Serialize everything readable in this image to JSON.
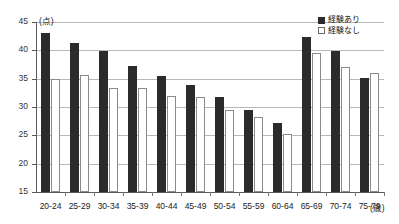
{
  "chart_data": {
    "type": "bar",
    "title": "",
    "subtitle": "",
    "xlabel": "(歳)",
    "ylabel": "(点)",
    "ylim": [
      15,
      45
    ],
    "ytick_step": 5,
    "yticks": [
      15,
      20,
      25,
      30,
      35,
      40,
      45
    ],
    "grid": true,
    "grid_axis": "y",
    "legend_position": "top-right",
    "categories": [
      "20-24",
      "25-29",
      "30-34",
      "35-39",
      "40-44",
      "45-49",
      "50-54",
      "55-59",
      "60-64",
      "65-69",
      "70-74",
      "75-79"
    ],
    "series": [
      {
        "name": "経験あり",
        "color": "#2b2b2b",
        "style": "filled",
        "values": [
          43.0,
          41.3,
          39.8,
          37.3,
          35.4,
          33.9,
          31.8,
          29.4,
          27.2,
          42.4,
          39.9,
          35.1
        ]
      },
      {
        "name": "経験なし",
        "color": "#ffffff",
        "style": "outlined",
        "values": [
          35.0,
          35.6,
          33.3,
          33.3,
          32.0,
          31.7,
          29.5,
          28.3,
          25.2,
          39.5,
          37.0,
          36.0
        ]
      }
    ]
  },
  "legend": {
    "items": [
      {
        "label": "経験あり",
        "marker": "filled-square"
      },
      {
        "label": "経験なし",
        "marker": "outlined-square"
      }
    ]
  },
  "axes": {
    "y_unit_label": "(点)",
    "x_unit_label": "(歳)"
  }
}
